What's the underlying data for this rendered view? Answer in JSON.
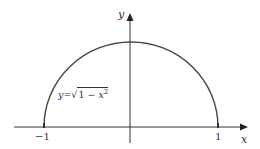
{
  "diagram": {
    "axes": {
      "x_label": "x",
      "y_label": "y"
    },
    "ticks": {
      "left": "−1",
      "right": "1"
    },
    "curve": {
      "equation_lhs": "y",
      "equation_eq": "=",
      "equation_radicand_const": "1",
      "equation_minus": "−",
      "equation_var": "x",
      "equation_exp": "2",
      "color": "#444444"
    },
    "colors": {
      "axis": "#333333",
      "curve": "#444444",
      "background": "#ffffff"
    }
  }
}
